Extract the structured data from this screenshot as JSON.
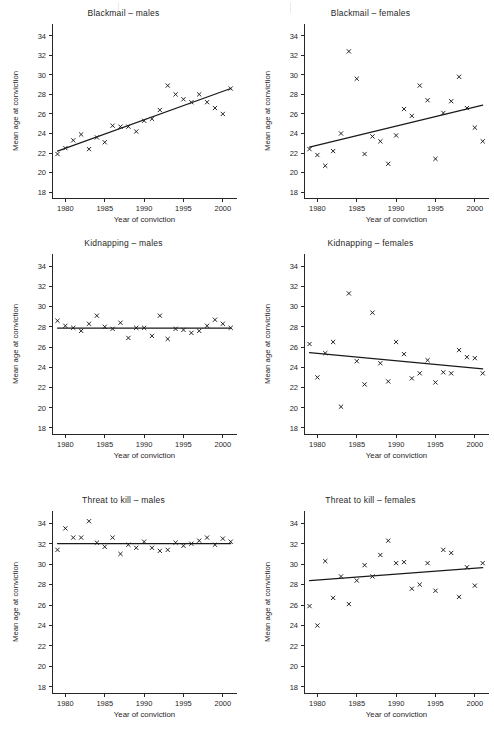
{
  "figure": {
    "shared_xlabel": "Year of conviction",
    "shared_ylabel": "Mean age at conviction",
    "xlim": [
      1978.3,
      2001.8
    ],
    "ylim": [
      17.4,
      35.2
    ],
    "xticks": [
      1980,
      1985,
      1990,
      1995,
      2000
    ],
    "yticks": [
      18,
      20,
      22,
      24,
      26,
      28,
      30,
      32,
      34
    ],
    "marker": "x",
    "grid": false,
    "legend": "none"
  },
  "chart_data": [
    {
      "type": "scatter",
      "panel": 1,
      "title": "Blackmail – males",
      "xlabel": "Year of conviction",
      "ylabel": "Mean age at conviction",
      "xlim": [
        1978.3,
        2001.8
      ],
      "ylim": [
        17.4,
        35.2
      ],
      "xticks": [
        1980,
        1985,
        1990,
        1995,
        2000
      ],
      "yticks": [
        18,
        20,
        22,
        24,
        26,
        28,
        30,
        32,
        34
      ],
      "x": [
        1979,
        1980,
        1981,
        1982,
        1983,
        1984,
        1985,
        1986,
        1987,
        1988,
        1989,
        1990,
        1991,
        1992,
        1993,
        1994,
        1995,
        1996,
        1997,
        1998,
        1999,
        2000,
        2001
      ],
      "y": [
        21.9,
        22.5,
        23.3,
        23.9,
        22.4,
        23.6,
        23.1,
        24.8,
        24.7,
        24.7,
        24.2,
        25.3,
        25.5,
        26.4,
        28.9,
        28.0,
        27.5,
        27.2,
        28.0,
        27.2,
        26.6,
        26.0,
        28.6
      ],
      "trend_line": {
        "x": [
          1979,
          2001
        ],
        "y": [
          22.2,
          28.6
        ]
      }
    },
    {
      "type": "scatter",
      "panel": 2,
      "title": "Blackmail – females",
      "xlabel": "Year of conviction",
      "ylabel": "Mean age at conviction",
      "xlim": [
        1978.3,
        2001.8
      ],
      "ylim": [
        17.4,
        35.2
      ],
      "xticks": [
        1980,
        1985,
        1990,
        1995,
        2000
      ],
      "yticks": [
        18,
        20,
        22,
        24,
        26,
        28,
        30,
        32,
        34
      ],
      "x": [
        1979,
        1980,
        1981,
        1982,
        1983,
        1984,
        1985,
        1986,
        1987,
        1988,
        1989,
        1990,
        1991,
        1992,
        1993,
        1994,
        1995,
        1996,
        1997,
        1998,
        1999,
        2000,
        2001
      ],
      "y": [
        22.4,
        21.8,
        20.7,
        22.2,
        24.0,
        32.4,
        29.6,
        21.9,
        23.7,
        23.2,
        20.9,
        23.8,
        26.5,
        25.8,
        28.9,
        27.4,
        21.4,
        26.1,
        27.3,
        29.8,
        26.6,
        24.6,
        23.2
      ],
      "trend_line": {
        "x": [
          1979,
          2001
        ],
        "y": [
          22.6,
          26.9
        ]
      }
    },
    {
      "type": "scatter",
      "panel": 3,
      "title": "Kidnapping – males",
      "xlabel": "Year of conviction",
      "ylabel": "Mean age at conviction",
      "xlim": [
        1978.3,
        2001.8
      ],
      "ylim": [
        17.4,
        35.2
      ],
      "xticks": [
        1980,
        1985,
        1990,
        1995,
        2000
      ],
      "yticks": [
        18,
        20,
        22,
        24,
        26,
        28,
        30,
        32,
        34
      ],
      "x": [
        1979,
        1980,
        1981,
        1982,
        1983,
        1984,
        1985,
        1986,
        1987,
        1988,
        1989,
        1990,
        1991,
        1992,
        1993,
        1994,
        1995,
        1996,
        1997,
        1998,
        1999,
        2000,
        2001
      ],
      "y": [
        28.6,
        28.1,
        27.9,
        27.6,
        28.3,
        29.1,
        28.0,
        27.8,
        28.4,
        26.9,
        27.9,
        27.9,
        27.1,
        29.1,
        26.8,
        27.8,
        27.7,
        27.4,
        27.6,
        28.1,
        28.7,
        28.3,
        27.9
      ],
      "trend_line": {
        "x": [
          1979,
          2001
        ],
        "y": [
          27.88,
          27.88
        ]
      }
    },
    {
      "type": "scatter",
      "panel": 4,
      "title": "Kidnapping – females",
      "xlabel": "Year of conviction",
      "ylabel": "Mean age at conviction",
      "xlim": [
        1978.3,
        2001.8
      ],
      "ylim": [
        17.4,
        35.2
      ],
      "xticks": [
        1980,
        1985,
        1990,
        1995,
        2000
      ],
      "yticks": [
        18,
        20,
        22,
        24,
        26,
        28,
        30,
        32,
        34
      ],
      "x": [
        1979,
        1980,
        1981,
        1982,
        1983,
        1984,
        1985,
        1986,
        1987,
        1988,
        1989,
        1990,
        1991,
        1992,
        1993,
        1994,
        1995,
        1996,
        1997,
        1998,
        1999,
        2000,
        2001
      ],
      "y": [
        26.3,
        23.0,
        25.4,
        26.5,
        20.1,
        31.3,
        24.6,
        22.3,
        29.4,
        24.4,
        22.6,
        26.5,
        25.3,
        22.9,
        23.4,
        24.7,
        22.5,
        23.5,
        23.4,
        25.7,
        25.0,
        24.9,
        23.4
      ],
      "trend_line": {
        "x": [
          1979,
          2001
        ],
        "y": [
          25.45,
          23.85
        ]
      }
    },
    {
      "type": "scatter",
      "panel": 5,
      "title": "Threat to kill – males",
      "xlabel": "Year of conviction",
      "ylabel": "Mean age at conviction",
      "xlim": [
        1978.3,
        2001.8
      ],
      "ylim": [
        17.4,
        35.2
      ],
      "xticks": [
        1980,
        1985,
        1990,
        1995,
        2000
      ],
      "yticks": [
        18,
        20,
        22,
        24,
        26,
        28,
        30,
        32,
        34
      ],
      "x": [
        1979,
        1980,
        1981,
        1982,
        1983,
        1984,
        1985,
        1986,
        1987,
        1988,
        1989,
        1990,
        1991,
        1992,
        1993,
        1994,
        1995,
        1996,
        1997,
        1998,
        1999,
        2000,
        2001
      ],
      "y": [
        31.4,
        33.5,
        32.6,
        32.6,
        34.2,
        32.1,
        31.7,
        32.6,
        31.0,
        31.9,
        31.6,
        32.2,
        31.6,
        31.3,
        31.4,
        32.1,
        31.8,
        32.0,
        32.3,
        32.6,
        31.9,
        32.5,
        32.2
      ],
      "trend_line": {
        "x": [
          1979,
          2001
        ],
        "y": [
          32.02,
          32.02
        ]
      }
    },
    {
      "type": "scatter",
      "panel": 6,
      "title": "Threat to kill – females",
      "xlabel": "Year of conviction",
      "ylabel": "Mean age at conviction",
      "xlim": [
        1978.3,
        2001.8
      ],
      "ylim": [
        17.4,
        35.2
      ],
      "xticks": [
        1980,
        1985,
        1990,
        1995,
        2000
      ],
      "yticks": [
        18,
        20,
        22,
        24,
        26,
        28,
        30,
        32,
        34
      ],
      "x": [
        1979,
        1980,
        1981,
        1982,
        1983,
        1984,
        1985,
        1986,
        1987,
        1988,
        1989,
        1990,
        1991,
        1992,
        1993,
        1994,
        1995,
        1996,
        1997,
        1998,
        1999,
        2000,
        2001
      ],
      "y": [
        25.9,
        24.0,
        30.3,
        26.7,
        28.8,
        26.1,
        28.4,
        29.9,
        28.8,
        30.9,
        32.3,
        30.1,
        30.2,
        27.6,
        28.0,
        30.1,
        27.4,
        31.4,
        31.1,
        26.8,
        29.7,
        27.9,
        30.1
      ],
      "trend_line": {
        "x": [
          1979,
          2001
        ],
        "y": [
          28.4,
          29.65
        ]
      }
    }
  ],
  "colors": {
    "axis": "#262626",
    "marker": "#1a1a1a",
    "trend": "#1a1a1a",
    "background": "#ffffff"
  }
}
